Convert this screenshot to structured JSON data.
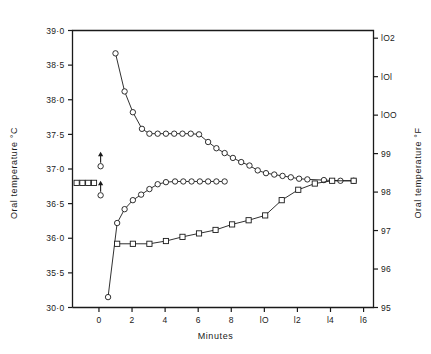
{
  "chart_data": {
    "type": "line",
    "title": "",
    "xlabel": "Minutes",
    "ylabel": "Oral temperature  °C",
    "ylabel_right": "Oral temperature  °F",
    "xlim": [
      -1.6,
      16.6
    ],
    "ylim": [
      35.0,
      39.0
    ],
    "ylim_right": [
      95.0,
      102.2
    ],
    "grid": false,
    "legend": "none",
    "xticks": [
      0,
      2,
      4,
      6,
      8,
      10,
      12,
      14,
      16
    ],
    "xticklabels": [
      "0",
      "2",
      "4",
      "6",
      "8",
      "lO",
      "l2",
      "l4",
      "l6"
    ],
    "yticks": [
      39.0,
      38.5,
      38.0,
      37.5,
      37.0,
      36.5,
      36.0,
      35.5,
      35.0
    ],
    "yticklabels": [
      "39·0",
      "38·5",
      "38·0",
      "37·5",
      "37·0",
      "36·5",
      "36·0",
      "35·5",
      "30·0"
    ],
    "yticks_right": [
      102,
      101,
      100,
      99,
      98,
      97,
      96,
      95
    ],
    "yticklabels_right": [
      "lO2",
      "lOl",
      "lOO",
      "99",
      "98",
      "97",
      "96",
      "95"
    ],
    "series": [
      {
        "name": "hot-drink-cooling-curve",
        "marker": "circle",
        "points": [
          [
            1.0,
            38.67
          ],
          [
            1.55,
            38.12
          ],
          [
            2.05,
            37.82
          ],
          [
            2.6,
            37.58
          ],
          [
            3.05,
            37.51
          ],
          [
            3.55,
            37.51
          ],
          [
            4.05,
            37.51
          ],
          [
            4.55,
            37.51
          ],
          [
            5.05,
            37.51
          ],
          [
            5.55,
            37.51
          ],
          [
            6.05,
            37.5
          ],
          [
            6.6,
            37.39
          ],
          [
            7.1,
            37.3
          ],
          [
            7.6,
            37.23
          ],
          [
            8.1,
            37.16
          ],
          [
            8.6,
            37.1
          ],
          [
            9.1,
            37.05
          ],
          [
            9.6,
            36.98
          ],
          [
            10.1,
            36.94
          ],
          [
            10.6,
            36.92
          ],
          [
            11.1,
            36.9
          ],
          [
            11.6,
            36.88
          ],
          [
            12.1,
            36.86
          ],
          [
            12.6,
            36.85
          ],
          [
            13.6,
            36.84
          ],
          [
            14.6,
            36.83
          ],
          [
            15.4,
            36.83
          ]
        ]
      },
      {
        "name": "rewarming-curve",
        "marker": "circle",
        "points": [
          [
            0.55,
            35.15
          ],
          [
            1.1,
            36.22
          ],
          [
            1.55,
            36.42
          ],
          [
            2.05,
            36.55
          ],
          [
            2.55,
            36.63
          ],
          [
            3.05,
            36.71
          ],
          [
            3.55,
            36.78
          ],
          [
            4.05,
            36.81
          ],
          [
            4.6,
            36.82
          ],
          [
            5.1,
            36.82
          ],
          [
            5.6,
            36.82
          ],
          [
            6.1,
            36.82
          ],
          [
            6.6,
            36.82
          ],
          [
            7.1,
            36.82
          ],
          [
            7.6,
            36.82
          ]
        ]
      },
      {
        "name": "cold-drink-recovery-curve",
        "marker": "square",
        "points": [
          [
            1.1,
            35.92
          ],
          [
            2.05,
            35.92
          ],
          [
            3.05,
            35.92
          ],
          [
            4.05,
            35.96
          ],
          [
            5.05,
            36.02
          ],
          [
            6.05,
            36.07
          ],
          [
            7.05,
            36.12
          ],
          [
            8.05,
            36.2
          ],
          [
            9.05,
            36.26
          ],
          [
            10.05,
            36.33
          ],
          [
            11.05,
            36.55
          ],
          [
            12.05,
            36.7
          ],
          [
            13.05,
            36.79
          ],
          [
            14.1,
            36.83
          ],
          [
            15.4,
            36.83
          ]
        ]
      },
      {
        "name": "baseline-control",
        "marker": "square",
        "points": [
          [
            -1.35,
            36.8
          ],
          [
            -1.0,
            36.8
          ],
          [
            -0.65,
            36.8
          ],
          [
            -0.3,
            36.8
          ]
        ]
      }
    ],
    "annotations": [
      {
        "name": "upper-arrow-marker",
        "x": 0.1,
        "y": 37.04,
        "arrow": "up",
        "marker": "circle"
      },
      {
        "name": "lower-arrow-marker",
        "x": 0.1,
        "y": 36.62,
        "arrow": "up",
        "marker": "circle"
      }
    ]
  }
}
